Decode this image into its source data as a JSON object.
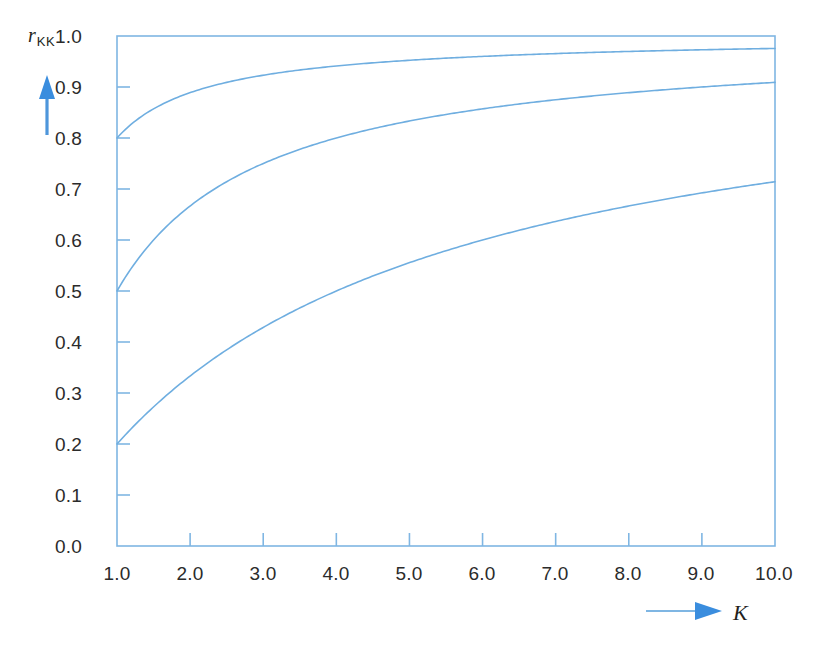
{
  "chart_data": {
    "type": "line",
    "title": "",
    "xlabel": "K",
    "ylabel": "r_KK",
    "xlim": [
      1.0,
      10.0
    ],
    "ylim": [
      0.0,
      1.0
    ],
    "grid": false,
    "legend": "none",
    "x_tick_labels": [
      "1.0",
      "2.0",
      "3.0",
      "4.0",
      "5.0",
      "6.0",
      "7.0",
      "8.0",
      "9.0",
      "10.0"
    ],
    "x_ticks": [
      1.0,
      2.0,
      3.0,
      4.0,
      5.0,
      6.0,
      7.0,
      8.0,
      9.0,
      10.0
    ],
    "y_tick_labels": [
      "0.0",
      "0.1",
      "0.2",
      "0.3",
      "0.4",
      "0.5",
      "0.6",
      "0.7",
      "0.8",
      "0.9",
      "1.0"
    ],
    "y_ticks": [
      0.0,
      0.1,
      0.2,
      0.3,
      0.4,
      0.5,
      0.6,
      0.7,
      0.8,
      0.9,
      1.0
    ],
    "x": [
      1.0,
      1.25,
      1.5,
      1.75,
      2.0,
      2.5,
      3.0,
      3.5,
      4.0,
      4.5,
      5.0,
      5.5,
      6.0,
      6.5,
      7.0,
      7.5,
      8.0,
      8.5,
      9.0,
      9.5,
      10.0
    ],
    "series": [
      {
        "name": "r = 0.8",
        "r0": 0.8,
        "color": "#6FAEE0",
        "values": [
          0.8,
          0.833,
          0.857,
          0.875,
          0.889,
          0.909,
          0.923,
          0.933,
          0.941,
          0.947,
          0.952,
          0.957,
          0.96,
          0.963,
          0.966,
          0.968,
          0.97,
          0.971,
          0.973,
          0.974,
          0.976
        ]
      },
      {
        "name": "r = 0.5",
        "r0": 0.5,
        "color": "#6FAEE0",
        "values": [
          0.5,
          0.556,
          0.6,
          0.636,
          0.667,
          0.714,
          0.75,
          0.778,
          0.8,
          0.818,
          0.833,
          0.846,
          0.857,
          0.867,
          0.875,
          0.882,
          0.889,
          0.895,
          0.9,
          0.905,
          0.909
        ]
      },
      {
        "name": "r = 0.2",
        "r0": 0.2,
        "color": "#6FAEE0",
        "values": [
          0.2,
          0.238,
          0.273,
          0.304,
          0.333,
          0.385,
          0.429,
          0.467,
          0.5,
          0.529,
          0.556,
          0.579,
          0.6,
          0.619,
          0.636,
          0.652,
          0.667,
          0.68,
          0.692,
          0.704,
          0.714
        ]
      }
    ],
    "formula": "r_KK = K*r / (1 + (K-1)*r)"
  },
  "axes": {
    "y_axis_label": "r",
    "y_axis_label_sub": "KK",
    "x_axis_label": "K",
    "y_arrow": "up-arrow-icon",
    "x_arrow": "right-arrow-icon"
  },
  "colors": {
    "line": "#6FAEE0",
    "frame": "#7FB6E3",
    "arrow": "#3A8DDE",
    "text": "#231f20",
    "background": "#ffffff"
  }
}
